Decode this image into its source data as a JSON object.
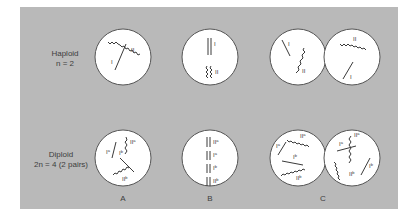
{
  "figure": {
    "rows": [
      {
        "label_line1": "Haploid",
        "label_line2": "n = 2"
      },
      {
        "label_line1": "Diploid",
        "label_line2": "2n = 4 (2 pairs)"
      }
    ],
    "columns": [
      {
        "label": "A"
      },
      {
        "label": "B"
      },
      {
        "label": "C"
      }
    ],
    "chromosome_labels": {
      "I": "I",
      "II": "II",
      "Ia": "I",
      "Ib": "I",
      "IIa": "II",
      "IIb": "II",
      "sup_a": "a",
      "sup_b": "b"
    },
    "colors": {
      "panel": "#b9b9b9",
      "cell_fill": "#ffffff",
      "cell_stroke": "#555555",
      "ink": "#3a3a3a"
    }
  }
}
